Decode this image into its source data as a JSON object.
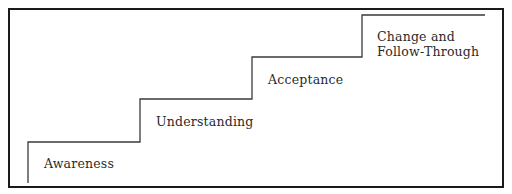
{
  "diagram": {
    "type": "staircase",
    "stroke_color": "#3a3a3a",
    "frame_color": "#1a1a1a",
    "steps": [
      {
        "label": "Awareness"
      },
      {
        "label": "Understanding"
      },
      {
        "label": "Acceptance"
      },
      {
        "label": "Change and Follow-Through",
        "lines": [
          "Change and",
          "Follow-Through"
        ]
      }
    ]
  }
}
